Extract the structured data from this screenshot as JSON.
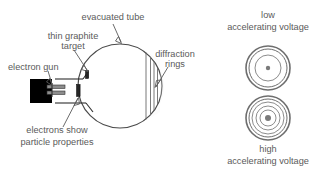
{
  "figure": {
    "title_text": "",
    "background_color": "#ffffff",
    "line_color": "#5a5a5a",
    "text_color": "#5a5a5a"
  },
  "labels": {
    "evacuated_tube": "evacuated tube",
    "thin_graphite_target_line1": "thin graphite",
    "thin_graphite_target_line2": "target",
    "electron_gun": "electron gun",
    "diffraction_rings_line1": "diffraction",
    "diffraction_rings_line2": "rings",
    "electrons_show_line1": "electrons show",
    "electrons_show_line2": "particle properties",
    "low_voltage_line1": "low",
    "low_voltage_line2": "accelerating voltage",
    "high_voltage_line1": "high",
    "high_voltage_line2": "accelerating voltage"
  },
  "ring_patterns": {
    "low": {
      "caption_line1": "low",
      "caption_line2": "accelerating voltage",
      "center_x": 268,
      "center_y": 68,
      "outer_radius": 22,
      "ring_radii": [
        22,
        19,
        13
      ],
      "center_dot_radius": 2.2
    },
    "high": {
      "caption_line1": "high",
      "caption_line2": "accelerating voltage",
      "center_x": 268,
      "center_y": 118,
      "outer_radius": 22,
      "ring_radii": [
        22,
        19,
        16,
        12,
        8
      ],
      "center_dot_radius": 3.0
    }
  },
  "tube": {
    "center_x": 120,
    "center_y": 86,
    "radius": 42,
    "screen_line_x_positions": [
      148,
      152,
      156,
      160
    ]
  }
}
